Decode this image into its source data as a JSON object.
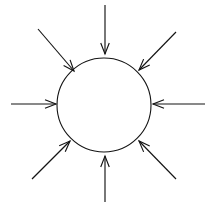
{
  "diagram": {
    "background_color": "#ffffff",
    "stroke_color": "#141414",
    "canvas": {
      "width": 209,
      "height": 206
    },
    "circle": {
      "label": "central-circle",
      "center_x": 104,
      "center_y": 105,
      "radius": 47,
      "fill": "none",
      "stroke_width": 1.1
    },
    "arrow_count": 8,
    "arrow_direction": "inward",
    "arrowhead_style": "open-barbed",
    "arrows": [
      {
        "name": "arrow-top",
        "direction_label": "north",
        "angle_deg": 90,
        "tail_x": 105,
        "tail_y": 5,
        "tip_x": 105,
        "tip_y": 54
      },
      {
        "name": "arrow-top-right",
        "direction_label": "northeast",
        "angle_deg": 45,
        "tail_x": 176,
        "tail_y": 32,
        "tip_x": 139,
        "tip_y": 70
      },
      {
        "name": "arrow-right",
        "direction_label": "east",
        "angle_deg": 0,
        "tail_x": 205,
        "tail_y": 104,
        "tip_x": 153,
        "tip_y": 104
      },
      {
        "name": "arrow-bottom-right",
        "direction_label": "southeast",
        "angle_deg": 315,
        "tail_x": 176,
        "tail_y": 179,
        "tip_x": 139,
        "tip_y": 141
      },
      {
        "name": "arrow-bottom",
        "direction_label": "south",
        "angle_deg": 270,
        "tail_x": 105,
        "tail_y": 202,
        "tip_x": 105,
        "tip_y": 156
      },
      {
        "name": "arrow-bottom-left",
        "direction_label": "southwest",
        "angle_deg": 225,
        "tail_x": 32,
        "tail_y": 179,
        "tip_x": 70,
        "tip_y": 141
      },
      {
        "name": "arrow-left",
        "direction_label": "west",
        "angle_deg": 180,
        "tail_x": 11,
        "tail_y": 104,
        "tip_x": 56,
        "tip_y": 104
      },
      {
        "name": "arrow-top-left",
        "direction_label": "northwest",
        "angle_deg": 135,
        "tail_x": 38,
        "tail_y": 29,
        "tip_x": 74,
        "tip_y": 71
      }
    ]
  }
}
